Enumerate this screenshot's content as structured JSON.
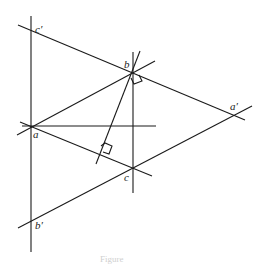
{
  "figure": {
    "labels": {
      "c_prime": "c′",
      "b": "b",
      "a": "a",
      "a_prime": "a′",
      "c": "c",
      "b_prime": "b′"
    },
    "caption": "Figure"
  }
}
